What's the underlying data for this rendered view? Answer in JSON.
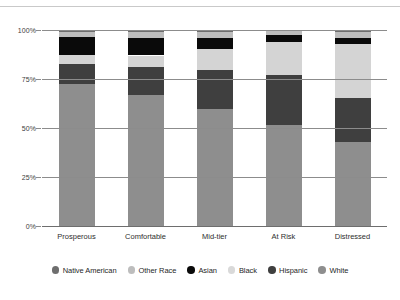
{
  "chart_data": {
    "type": "bar",
    "subtype": "stacked-bar-100-percent",
    "title": "",
    "xlabel": "",
    "ylabel": "",
    "ylim": [
      0,
      100
    ],
    "ytick_labels": [
      "0%",
      "25%",
      "50%",
      "75%",
      "100%"
    ],
    "ytick_values": [
      0,
      25,
      50,
      75,
      100
    ],
    "grid": true,
    "legend_position": "bottom",
    "categories": [
      "Prosperous",
      "Comfortable",
      "Mid-tier",
      "At Risk",
      "Distressed"
    ],
    "stack_order_bottom_to_top": [
      "White",
      "Hispanic",
      "Black",
      "Asian",
      "Other Race",
      "Native American"
    ],
    "series": [
      {
        "name": "White",
        "color": "#8e8e8e",
        "values": [
          72.5,
          67.0,
          59.5,
          51.5,
          43.0
        ]
      },
      {
        "name": "Hispanic",
        "color": "#3f3f3f",
        "values": [
          10.0,
          14.0,
          20.0,
          25.5,
          22.5
        ]
      },
      {
        "name": "Black",
        "color": "#d4d4d4",
        "values": [
          5.0,
          6.0,
          11.0,
          17.0,
          27.5
        ]
      },
      {
        "name": "Asian",
        "color": "#0a0a0a",
        "values": [
          9.0,
          9.0,
          5.5,
          3.5,
          3.0
        ]
      },
      {
        "name": "Other Race",
        "color": "#bdbdbd",
        "values": [
          2.5,
          3.0,
          3.0,
          2.0,
          3.0
        ]
      },
      {
        "name": "Native American",
        "color": "#6e6e6e",
        "values": [
          1.0,
          1.0,
          1.0,
          0.5,
          1.0
        ]
      }
    ]
  },
  "legend": {
    "items": [
      {
        "label": "Native American",
        "color": "#6e6e6e"
      },
      {
        "label": "Other Race",
        "color": "#bdbdbd"
      },
      {
        "label": "Asian",
        "color": "#0a0a0a"
      },
      {
        "label": "Black",
        "color": "#d9d9d9"
      },
      {
        "label": "Hispanic",
        "color": "#3f3f3f"
      },
      {
        "label": "White",
        "color": "#8e8e8e"
      }
    ]
  }
}
